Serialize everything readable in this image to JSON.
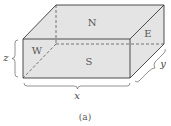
{
  "figure": {
    "caption": "(a)",
    "faces": {
      "north": "N",
      "south": "S",
      "east": "E",
      "west": "W"
    },
    "dimensions": {
      "x": "x",
      "y": "y",
      "z": "z"
    },
    "colors": {
      "fill": "#e4e4e4",
      "edge": "#3a3a3a",
      "hidden_edge": "#555555",
      "brace": "#666666"
    }
  }
}
